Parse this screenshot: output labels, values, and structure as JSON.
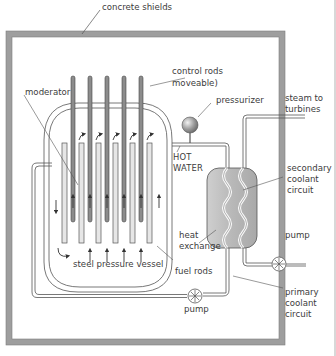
{
  "diagram": {
    "type": "pressurized water reactor schematic",
    "labels": {
      "concrete_shields": "concrete shields",
      "control_rods_1": "control rods",
      "control_rods_2": "moveable)",
      "moderator": "moderator",
      "pressurizer": "pressurizer",
      "steam_1": "steam to",
      "steam_2": "turbines",
      "hot_water_1": "HOT",
      "hot_water_2": "WATER",
      "secondary_1": "secondary",
      "secondary_2": "coolant",
      "secondary_3": "circuit",
      "heat_exchange_1": "heat",
      "heat_exchange_2": "exchange",
      "pump_right": "pump",
      "fuel_rods": "fuel rods",
      "steel_vessel": "steel pressure vessel",
      "pump_bottom": "pump",
      "primary_1": "primary",
      "primary_2": "coolant",
      "primary_3": "circuit"
    },
    "components": [
      "concrete shield",
      "steel pressure vessel",
      "control rods",
      "fuel rods",
      "moderator",
      "pressurizer",
      "heat exchanger",
      "primary pump",
      "secondary pump",
      "primary coolant circuit",
      "secondary coolant circuit"
    ],
    "counts": {
      "control_rods": 5,
      "fuel_rods": 6
    },
    "colors": {
      "shield": "#9e9e9e",
      "pipe": "#555555",
      "exchanger_fill": "#bdbdbd",
      "text": "#3c3c3c"
    }
  }
}
